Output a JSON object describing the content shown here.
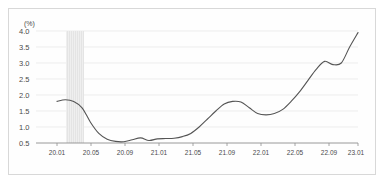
{
  "chart_data": {
    "type": "line",
    "title": "",
    "subtitle": "",
    "xlabel": "",
    "ylabel": "",
    "unit_label": "(%)",
    "ylim": [
      0.5,
      4.0
    ],
    "yticks": [
      4.0,
      3.5,
      3.0,
      2.5,
      2.0,
      1.5,
      1.0,
      0.5
    ],
    "ytick_labels": [
      "4.0",
      "3.5",
      "3.0",
      "2.5",
      "2.0",
      "1.5",
      "1.0",
      "0.5"
    ],
    "xtick_labels": [
      "20.01",
      "20.05",
      "20.09",
      "21.01",
      "21.05",
      "21.09",
      "22.01",
      "22.05",
      "22.09",
      "23.01"
    ],
    "grid": true,
    "grid_axis": "y",
    "legend": null,
    "legend_position": "none",
    "line_color": "#555555",
    "line_width": 1.1,
    "grid_color": "#ededed",
    "axis_color": "#9a9a9a",
    "shaded_band": {
      "label": "",
      "x_start": "20.03",
      "x_end": "20.04",
      "color": "#e8e8e8",
      "hatch": "vertical-lines"
    },
    "x": [
      "20.01",
      "20.02",
      "20.03",
      "20.04",
      "20.05",
      "20.06",
      "20.07",
      "20.08",
      "20.09",
      "20.10",
      "20.11",
      "20.12",
      "21.01",
      "21.02",
      "21.03",
      "21.04",
      "21.05",
      "21.06",
      "21.07",
      "21.08",
      "21.09",
      "21.10",
      "21.11",
      "21.12",
      "22.01",
      "22.02",
      "22.03",
      "22.04",
      "22.05",
      "22.06",
      "22.07",
      "22.08",
      "22.09",
      "22.10",
      "22.11",
      "22.12",
      "23.01"
    ],
    "values": [
      1.8,
      1.85,
      1.8,
      1.6,
      1.15,
      0.8,
      0.62,
      0.55,
      0.54,
      0.6,
      0.66,
      0.58,
      0.63,
      0.64,
      0.65,
      0.7,
      0.8,
      1.0,
      1.25,
      1.5,
      1.72,
      1.8,
      1.78,
      1.6,
      1.42,
      1.38,
      1.42,
      1.55,
      1.8,
      2.1,
      2.45,
      2.8,
      3.05,
      2.95,
      3.0,
      3.5,
      3.95
    ],
    "annotations": [],
    "series_count": 1,
    "value_range": [
      0.54,
      3.95
    ],
    "peak_value": 4.0,
    "peak_x": "22.11",
    "final_value": 3.6
  }
}
